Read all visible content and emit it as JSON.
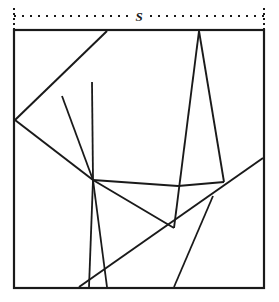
{
  "figure": {
    "kind": "geometric-line-diagram",
    "background_color": "#ffffff",
    "stroke_color": "#1a1a1a",
    "canvas": {
      "width": 279,
      "height": 302
    }
  },
  "dimension": {
    "label": "S",
    "label_x": 139,
    "label_y": 16,
    "line_y": 16,
    "x_start": 14,
    "x_end": 264,
    "tick_top": 8,
    "tick_bottom": 30,
    "style": "dotted"
  },
  "square": {
    "name": "outer-square",
    "x": 14,
    "y": 30,
    "width": 250,
    "height": 258,
    "stroke_width": 2.2
  },
  "vertices": {
    "left_fan": {
      "x": 15,
      "y": 120
    },
    "center_hub": {
      "x": 93,
      "y": 180
    },
    "top_left_line_end": {
      "x": 107,
      "y": 31
    },
    "apex_top": {
      "x": 199,
      "y": 31
    },
    "bottom_converge": {
      "x": 107,
      "y": 287
    },
    "right_edge_upper": {
      "x": 263,
      "y": 158
    },
    "right_shelf_left": {
      "x": 178,
      "y": 186
    },
    "right_shelf_right": {
      "x": 224,
      "y": 182
    },
    "lower_right_leg_top": {
      "x": 213,
      "y": 196
    },
    "lower_right_leg_bottom": {
      "x": 174,
      "y": 287
    },
    "diag_bottom_left": {
      "x": 79,
      "y": 287
    },
    "apex_left_leg_bottom": {
      "x": 174,
      "y": 228
    },
    "small_v_left": {
      "x": 93,
      "y": 226
    }
  },
  "lines": [
    {
      "name": "line-left-vertex-to-top",
      "x1": 15,
      "y1": 120,
      "x2": 107,
      "y2": 31,
      "width": 2.0
    },
    {
      "name": "line-left-vertex-to-hub",
      "x1": 15,
      "y1": 120,
      "x2": 93,
      "y2": 180,
      "width": 2.0
    },
    {
      "name": "line-hub-to-upper-ray-a",
      "x1": 93,
      "y1": 180,
      "x2": 62,
      "y2": 96,
      "width": 1.8
    },
    {
      "name": "line-hub-to-upper-ray-b",
      "x1": 93,
      "y1": 180,
      "x2": 92,
      "y2": 82,
      "width": 1.8
    },
    {
      "name": "line-hub-to-bottom-converge",
      "x1": 93,
      "y1": 180,
      "x2": 107,
      "y2": 287,
      "width": 1.8
    },
    {
      "name": "line-hub-to-lower-left",
      "x1": 93,
      "y1": 180,
      "x2": 89,
      "y2": 287,
      "width": 1.8
    },
    {
      "name": "line-hub-to-apex-leg",
      "x1": 93,
      "y1": 180,
      "x2": 174,
      "y2": 228,
      "width": 1.8
    },
    {
      "name": "line-hub-to-right-shelf",
      "x1": 93,
      "y1": 180,
      "x2": 178,
      "y2": 186,
      "width": 1.8
    },
    {
      "name": "line-apex-left-leg",
      "x1": 199,
      "y1": 31,
      "x2": 174,
      "y2": 228,
      "width": 1.9
    },
    {
      "name": "line-apex-right-leg",
      "x1": 199,
      "y1": 31,
      "x2": 224,
      "y2": 182,
      "width": 1.9
    },
    {
      "name": "line-right-shelf-horizontal",
      "x1": 178,
      "y1": 186,
      "x2": 224,
      "y2": 182,
      "width": 1.8
    },
    {
      "name": "line-long-diagonal",
      "x1": 79,
      "y1": 287,
      "x2": 263,
      "y2": 158,
      "width": 2.0
    },
    {
      "name": "line-lower-right-leg",
      "x1": 213,
      "y1": 196,
      "x2": 174,
      "y2": 287,
      "width": 1.8
    }
  ],
  "annotations": {
    "caption": ""
  }
}
